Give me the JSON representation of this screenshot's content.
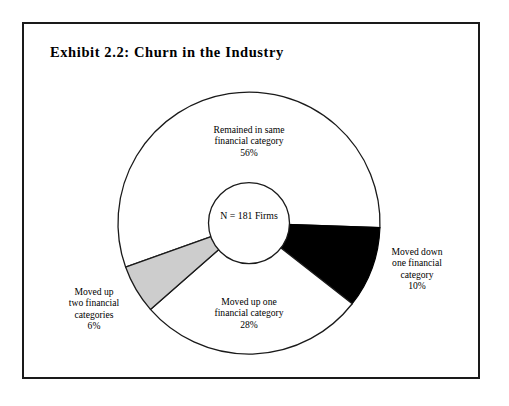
{
  "figure": {
    "title": "Exhibit 2.2:  Churn in the Industry",
    "center_line1": "N = 181",
    "center_line2": "Firms"
  },
  "colors": {
    "outline": "#1a1a1a",
    "frame": "#1a1a1a",
    "slice_white": "#ffffff",
    "slice_black": "#000000",
    "slice_gray": "#cdcdcd",
    "text": "#000000"
  },
  "labels": {
    "remained": {
      "line1": "Remained in same",
      "line2": "financial category",
      "pct": "56%"
    },
    "moved_down": {
      "line1": "Moved down",
      "line2": "one financial",
      "line3": "category",
      "pct": "10%"
    },
    "moved_up_one": {
      "line1": "Moved up one",
      "line2": "financial category",
      "pct": "28%"
    },
    "moved_up_two": {
      "line1": "Moved up",
      "line2": "two financial",
      "line3": "categories",
      "pct": "6%"
    }
  },
  "chart_data": {
    "type": "pie",
    "title": "Exhibit 2.2:  Churn in the Industry",
    "subtitle": "",
    "xlabel": "",
    "ylabel": "",
    "donut": true,
    "total_label": "N = 181 Firms",
    "sample_size": 181,
    "start_angle_deg": 92,
    "direction": "clockwise",
    "legend": "none",
    "grid": false,
    "categories": [
      "Moved down one financial category",
      "Moved up one financial category",
      "Moved up two financial categories",
      "Remained in same financial category"
    ],
    "values": [
      10,
      28,
      6,
      56
    ],
    "value_labels": [
      "10%",
      "28%",
      "6%",
      "56%"
    ],
    "slice_colors": [
      "#000000",
      "#ffffff",
      "#cdcdcd",
      "#ffffff"
    ],
    "units": "percent"
  }
}
